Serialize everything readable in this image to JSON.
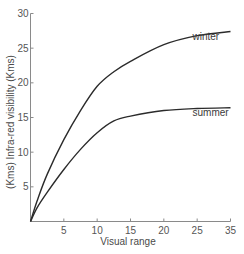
{
  "chart_data": {
    "type": "line",
    "title": "",
    "xlabel": "Visual range",
    "ylabel": "(Kms) Infra-red visibility (Kms)",
    "xlim": [
      0,
      30
    ],
    "ylim": [
      0,
      30
    ],
    "grid": false,
    "legend": "inline labels",
    "x_ticks": [
      {
        "pos": 5,
        "label": "5"
      },
      {
        "pos": 10,
        "label": "10"
      },
      {
        "pos": 15,
        "label": "15"
      },
      {
        "pos": 20,
        "label": "20"
      },
      {
        "pos": 25,
        "label": "25"
      },
      {
        "pos": 30,
        "label": "35"
      }
    ],
    "y_ticks": [
      {
        "pos": 5,
        "label": "5"
      },
      {
        "pos": 10,
        "label": "10"
      },
      {
        "pos": 15,
        "label": "15"
      },
      {
        "pos": 20,
        "label": "20"
      },
      {
        "pos": 25,
        "label": "25"
      },
      {
        "pos": 30,
        "label": "30"
      }
    ],
    "x": [
      0,
      1,
      2.5,
      5,
      7.5,
      10,
      12.5,
      15,
      20,
      25,
      30
    ],
    "series": [
      {
        "name": "winter",
        "values": [
          0,
          3.0,
          6.8,
          11.8,
          16.0,
          19.5,
          21.6,
          23.1,
          25.5,
          26.8,
          27.4
        ]
      },
      {
        "name": "summer",
        "values": [
          0,
          2.0,
          4.2,
          7.5,
          10.4,
          12.8,
          14.5,
          15.2,
          16.0,
          16.3,
          16.4
        ]
      }
    ],
    "annotations": [
      {
        "text": "winter",
        "x": 24.3,
        "y": 26.2
      },
      {
        "text": "summer",
        "x": 24.3,
        "y": 15.2
      }
    ]
  }
}
